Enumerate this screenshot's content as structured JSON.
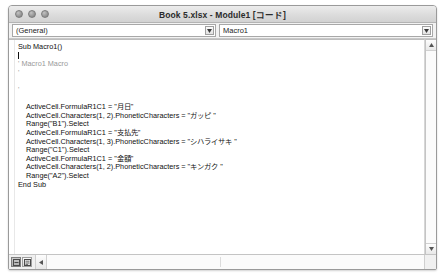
{
  "window": {
    "title": "Book 5.xlsx - Module1 [コード]",
    "traffic_lights": [
      "close-button",
      "minimize-button",
      "zoom-button"
    ]
  },
  "toolbar": {
    "object_combo": {
      "value": "(General)",
      "arrow_icon": "chevron-down-icon"
    },
    "procedure_combo": {
      "value": "Macro1",
      "arrow_icon": "chevron-down-icon"
    }
  },
  "code": {
    "lines": [
      {
        "text": "Sub Macro1()",
        "style": "code",
        "indent": false
      },
      {
        "text": "",
        "style": "caret",
        "indent": false
      },
      {
        "text": "' Macro1 Macro",
        "style": "comment",
        "indent": false
      },
      {
        "text": "'",
        "style": "comment",
        "indent": false
      },
      {
        "text": "",
        "style": "code",
        "indent": false
      },
      {
        "text": "'",
        "style": "comment",
        "indent": false
      },
      {
        "text": "",
        "style": "code",
        "indent": false
      },
      {
        "text": "ActiveCell.FormulaR1C1 = \"月日\"",
        "style": "code",
        "indent": true
      },
      {
        "text": "ActiveCell.Characters(1, 2).PhoneticCharacters = \"ガッピ \"",
        "style": "code",
        "indent": true
      },
      {
        "text": "Range(\"B1\").Select",
        "style": "code",
        "indent": true
      },
      {
        "text": "ActiveCell.FormulaR1C1 = \"支払先\"",
        "style": "code",
        "indent": true
      },
      {
        "text": "ActiveCell.Characters(1, 3).PhoneticCharacters = \"シハライサキ \"",
        "style": "code",
        "indent": true
      },
      {
        "text": "Range(\"C1\").Select",
        "style": "code",
        "indent": true
      },
      {
        "text": "ActiveCell.FormulaR1C1 = \"金額\"",
        "style": "code",
        "indent": true
      },
      {
        "text": "ActiveCell.Characters(1, 2).PhoneticCharacters = \"キンガク \"",
        "style": "code",
        "indent": true
      },
      {
        "text": "Range(\"A2\").Select",
        "style": "code",
        "indent": true
      },
      {
        "text": "End Sub",
        "style": "code",
        "indent": false
      }
    ]
  },
  "scrollbars": {
    "vertical": {
      "up_icon": "scroll-up-arrow-icon",
      "down_icon": "scroll-down-arrow-icon"
    },
    "horizontal": {
      "left_icon": "scroll-left-arrow-icon"
    }
  },
  "view_buttons": [
    {
      "name": "procedure-view-button",
      "icon": "procedure-view-icon",
      "active": true
    },
    {
      "name": "full-module-view-button",
      "icon": "full-module-view-icon",
      "active": false
    }
  ]
}
